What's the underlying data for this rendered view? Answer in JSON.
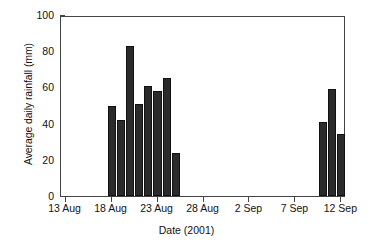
{
  "chart_data": {
    "type": "bar",
    "title": "",
    "xlabel": "Date (2001)",
    "ylabel": "Average daily rainfall (mm)",
    "ylim": [
      0,
      100
    ],
    "yticks": [
      0,
      20,
      40,
      60,
      80,
      100
    ],
    "ytick_labels": [
      "0",
      "20",
      "40",
      "60",
      "80",
      "100"
    ],
    "xlim": [
      "13 Aug",
      "13 Sep"
    ],
    "xticks": [
      "13 Aug",
      "18 Aug",
      "23 Aug",
      "28 Aug",
      "2 Sep",
      "7 Sep",
      "12 Sep"
    ],
    "xtick_labels": [
      "13 Aug",
      "18 Aug",
      "23 Aug",
      "28 Aug",
      "2 Sep",
      "7 Sep",
      "12 Sep"
    ],
    "grid": false,
    "legend": null,
    "bar_color": "#2b2b2b",
    "categories": [
      "18 Aug",
      "19 Aug",
      "20 Aug",
      "21 Aug",
      "22 Aug",
      "23 Aug",
      "24 Aug",
      "25 Aug",
      "10 Sep",
      "11 Sep",
      "12 Sep"
    ],
    "values": [
      50,
      42,
      83,
      51,
      61,
      58,
      65,
      24,
      41,
      59,
      34
    ],
    "points": [
      {
        "date": "18 Aug",
        "day_index": 5,
        "value": 50
      },
      {
        "date": "19 Aug",
        "day_index": 6,
        "value": 42
      },
      {
        "date": "20 Aug",
        "day_index": 7,
        "value": 83
      },
      {
        "date": "21 Aug",
        "day_index": 8,
        "value": 51
      },
      {
        "date": "22 Aug",
        "day_index": 9,
        "value": 61
      },
      {
        "date": "23 Aug",
        "day_index": 10,
        "value": 58
      },
      {
        "date": "24 Aug",
        "day_index": 11,
        "value": 65
      },
      {
        "date": "25 Aug",
        "day_index": 12,
        "value": 24
      },
      {
        "date": "10 Sep",
        "day_index": 28,
        "value": 41
      },
      {
        "date": "11 Sep",
        "day_index": 29,
        "value": 59
      },
      {
        "date": "12 Sep",
        "day_index": 30,
        "value": 34
      }
    ],
    "xtick_day_index": [
      0,
      5,
      10,
      15,
      20,
      25,
      30
    ],
    "total_days": 31
  }
}
